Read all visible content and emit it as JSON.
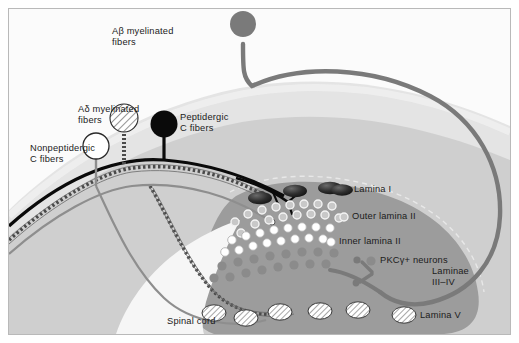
{
  "figure": {
    "frame_color": "#b9b9b9",
    "background": "#fbfbfb"
  },
  "colors": {
    "white_matter": "#e4e4e4",
    "gray_matter_outer": "#c3c3c3",
    "gray_matter_dorsal_horn": "#9a9a9a",
    "ventral_white": "#f4f4f4",
    "abeta": "#7a7a7a",
    "peptidergic_c": "#0a0a0a",
    "nonpeptidergic_c": "#ffffff",
    "adelta_hatch": "#ffffff",
    "pkc_gamma": "#8b8b8b",
    "lamina_one_cell": "#2b2b2b",
    "text": "#1b1b1b"
  },
  "afferents": [
    {
      "id": "abeta",
      "label_line1": "Aβ myelinated",
      "label_line2": "fibers",
      "marker": "filled-gray-circle",
      "color": "#7a7a7a",
      "label_x": 112,
      "label_y": 26
    },
    {
      "id": "adelta",
      "label_line1": "Aδ myelinated",
      "label_line2": "fibers",
      "marker": "hatched-circle",
      "color": "#ffffff",
      "label_x": 78,
      "label_y": 104
    },
    {
      "id": "peptidergic-c",
      "label_line1": "Peptidergic",
      "label_line2": "C fibers",
      "marker": "filled-black-circle",
      "color": "#0a0a0a",
      "label_x": 180,
      "label_y": 112
    },
    {
      "id": "nonpeptidergic-c",
      "label_line1": "Nonpeptidergic",
      "label_line2": "C fibers",
      "marker": "open-white-circle",
      "color": "#ffffff",
      "label_x": 30,
      "label_y": 143
    }
  ],
  "laminae": [
    {
      "id": "lamina-1",
      "label": "Lamina I",
      "marker": "dark-ellipse",
      "marker_color": "#2b2b2b",
      "label_x": 354,
      "label_y": 188
    },
    {
      "id": "outer-lamina-2",
      "label": "Outer lamina II",
      "marker": "small-open-circle",
      "marker_color": "#cfcfcf",
      "label_x": 350,
      "label_y": 214
    },
    {
      "id": "inner-lamina-2",
      "label": "Inner lamina II",
      "marker": "white-filled-circle",
      "marker_color": "#ffffff",
      "label_x": 338,
      "label_y": 239
    },
    {
      "id": "pkc-gamma-neurons",
      "label": "PKCγ+ neurons",
      "marker": "solid-gray-dot",
      "marker_color": "#8b8b8b",
      "label_x": 380,
      "label_y": 258
    },
    {
      "id": "laminae-3-4",
      "label_line1": "Laminae",
      "label_line2": "III–IV",
      "marker": "none",
      "label_x": 432,
      "label_y": 266
    },
    {
      "id": "lamina-5",
      "label": "Lamina V",
      "marker": "hatched-ellipse",
      "marker_color": "#ffffff",
      "label_x": 420,
      "label_y": 312
    }
  ],
  "anatomy": {
    "spinal_cord_label": "Spinal cord",
    "spinal_cord_x": 167,
    "spinal_cord_y": 320
  }
}
